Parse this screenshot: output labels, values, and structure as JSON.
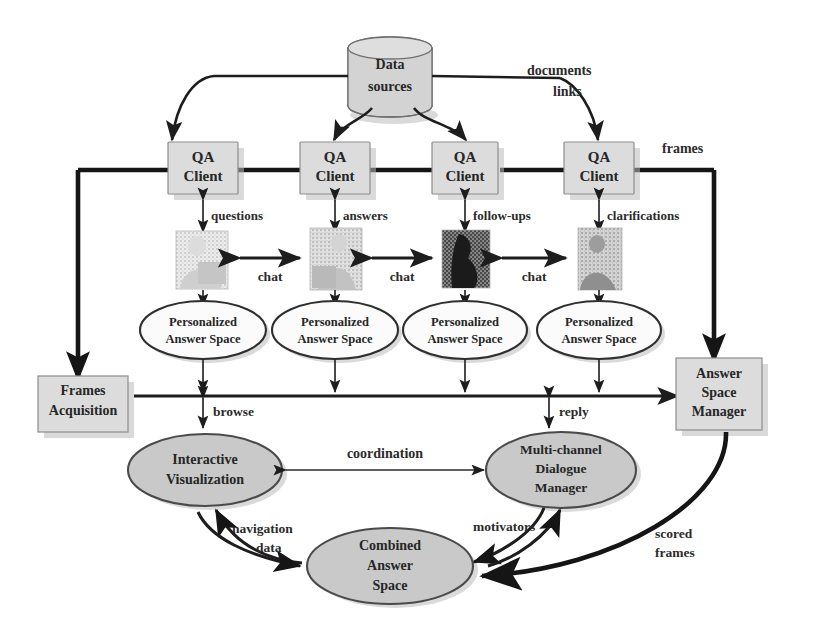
{
  "diagram": {
    "background_color": "#ffffff",
    "ink_color": "#1d1d1d",
    "box_fill": "#dcdcdc",
    "ellipse_gray_fill": "#c9c9c9",
    "ellipse_white_fill": "#fbfbfb",
    "cylinder_fill": "#d3d3d3"
  },
  "nodes": {
    "data_sources": {
      "line1": "Data",
      "line2": "sources"
    },
    "qa_clients": [
      {
        "line1": "QA",
        "line2": "Client"
      },
      {
        "line1": "QA",
        "line2": "Client"
      },
      {
        "line1": "QA",
        "line2": "Client"
      },
      {
        "line1": "QA",
        "line2": "Client"
      }
    ],
    "personalized_answer_spaces": [
      {
        "line1": "Personalized",
        "line2": "Answer Space"
      },
      {
        "line1": "Personalized",
        "line2": "Answer Space"
      },
      {
        "line1": "Personalized",
        "line2": "Answer Space"
      },
      {
        "line1": "Personalized",
        "line2": "Answer Space"
      }
    ],
    "frames_acquisition": {
      "line1": "Frames",
      "line2": "Acquisition"
    },
    "answer_space_manager": {
      "line1": "Answer",
      "line2": "Space",
      "line3": "Manager"
    },
    "interactive_visualization": {
      "line1": "Interactive",
      "line2": "Visualization"
    },
    "multi_channel_dialogue_manager": {
      "line1": "Multi-channel",
      "line2": "Dialogue",
      "line3": "Manager"
    },
    "combined_answer_space": {
      "line1": "Combined",
      "line2": "Answer",
      "line3": "Space"
    }
  },
  "edge_labels": {
    "documents_links_1": "documents",
    "documents_links_2": "links",
    "questions": "questions",
    "answers": "answers",
    "follow_ups": "follow-ups",
    "clarifications": "clarifications",
    "frames": "frames",
    "chat_1": "chat",
    "chat_2": "chat",
    "chat_3": "chat",
    "browse": "browse",
    "reply": "reply",
    "coordination": "coordination",
    "navigation_1": "navigation",
    "navigation_2": "data",
    "motivators": "motivators",
    "scored_1": "scored",
    "scored_2": "frames"
  }
}
